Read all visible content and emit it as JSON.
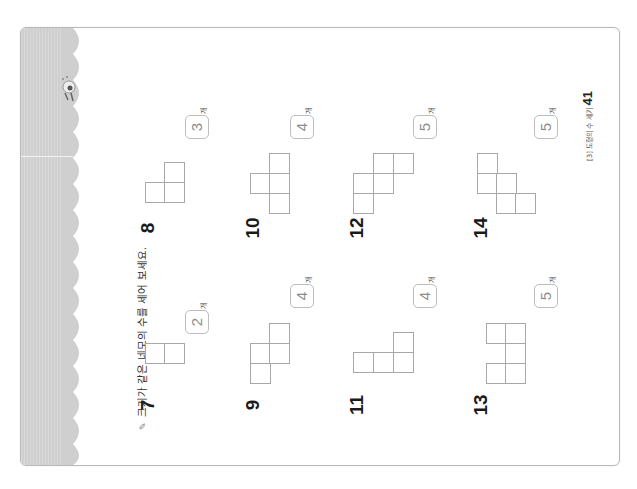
{
  "instruction": {
    "icon": "pencil-bullet-icon",
    "text": "크기가 같은 네모의 수를 세어 보세요."
  },
  "unit_label": "개",
  "footer": {
    "chapter": "[3] 도형의 수 세기",
    "page_number": "41"
  },
  "questions": [
    {
      "number": "7",
      "answer": "2"
    },
    {
      "number": "8",
      "answer": "3"
    },
    {
      "number": "9",
      "answer": "4"
    },
    {
      "number": "10",
      "answer": "4"
    },
    {
      "number": "11",
      "answer": "4"
    },
    {
      "number": "12",
      "answer": "5"
    },
    {
      "number": "13",
      "answer": "5"
    },
    {
      "number": "14",
      "answer": "5"
    }
  ],
  "colors": {
    "side_band": "#cfcfcf",
    "cell_border": "#a8a8a8",
    "answer_text": "#8c8c8c",
    "page_border": "#b9b9b9"
  }
}
